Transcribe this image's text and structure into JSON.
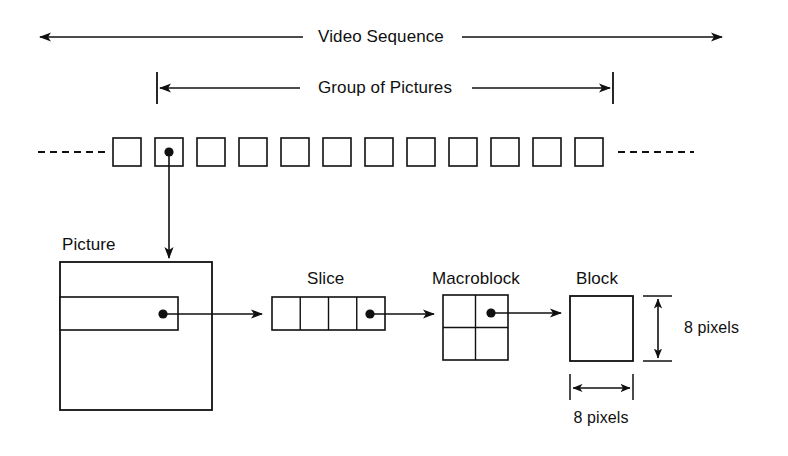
{
  "diagram": {
    "background_color": "#ffffff",
    "line_color": "#101010",
    "text_color": "#101010"
  },
  "spans": {
    "video_sequence": {
      "label": "Video Sequence",
      "arrow_style": "double-headed",
      "x_start": 40,
      "x_end": 722,
      "y": 37,
      "label_center_x": 381
    },
    "group_of_pictures": {
      "label": "Group of Pictures",
      "arrow_style": "double-headed-with-end-bars",
      "x_start": 157,
      "x_end": 613,
      "y": 88,
      "label_center_x": 385
    }
  },
  "frame_strip": {
    "name": "picture-frame-strip",
    "frame_count": 12,
    "frame_width": 28,
    "frame_height": 28,
    "frame_pitch": 42,
    "first_frame_x": 113,
    "y_top": 138,
    "dashed_lead_in": true,
    "dashed_lead_out": true,
    "marked_frame_index": 2,
    "marker": "black-dot"
  },
  "stages": [
    {
      "id": "picture",
      "label": "Picture",
      "label_x": 62,
      "label_y": 236,
      "box": {
        "x": 60,
        "y": 262,
        "w": 152,
        "h": 148
      },
      "slice_strip": {
        "x": 60,
        "y": 297,
        "w": 118,
        "h": 33
      },
      "dot": {
        "x": 163,
        "y": 314
      }
    },
    {
      "id": "slice",
      "label": "Slice",
      "label_x": 328,
      "label_y": 270,
      "box": {
        "x": 272,
        "y": 297,
        "w": 113,
        "h": 33
      },
      "cells": 4,
      "dot": {
        "x": 370,
        "y": 314
      }
    },
    {
      "id": "macroblock",
      "label": "Macroblock",
      "label_x": 476,
      "label_y": 270,
      "box": {
        "x": 443,
        "y": 295,
        "w": 65,
        "h": 65
      },
      "cells": "2x2",
      "dot": {
        "x": 491,
        "y": 313
      }
    },
    {
      "id": "block",
      "label": "Block",
      "label_x": 602,
      "label_y": 270,
      "box": {
        "x": 570,
        "y": 296,
        "w": 63,
        "h": 65
      }
    }
  ],
  "connectors": [
    {
      "from": "frame-2",
      "to": "picture-box",
      "direction": "down"
    },
    {
      "from": "picture-dot",
      "to": "slice-box",
      "direction": "right"
    },
    {
      "from": "slice-dot",
      "to": "macroblock-box",
      "direction": "right"
    },
    {
      "from": "macroblock-dot",
      "to": "block-box",
      "direction": "right"
    }
  ],
  "dimensions": {
    "block_height": {
      "label": "8 pixels",
      "orientation": "vertical",
      "label_x": 676,
      "label_y": 320,
      "line_x": 658,
      "y_top": 296,
      "y_bottom": 361
    },
    "block_width": {
      "label": "8 pixels",
      "orientation": "horizontal",
      "label_center_x": 601,
      "label_y": 418,
      "line_y": 388,
      "x_left": 570,
      "x_right": 633
    }
  }
}
